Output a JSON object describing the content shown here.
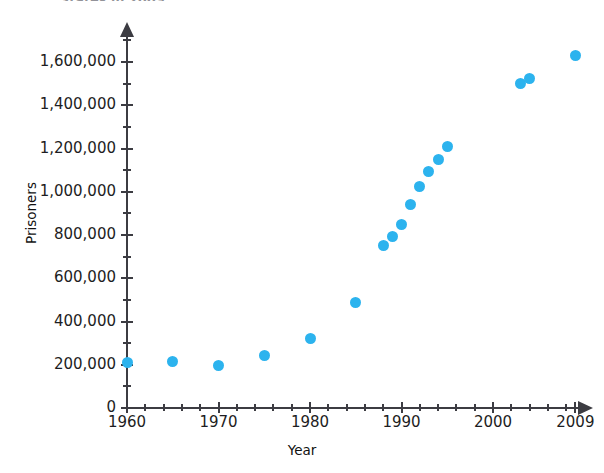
{
  "chart_data": {
    "type": "scatter",
    "title": "States in 2009",
    "xlabel": "Year",
    "ylabel": "Prisoners",
    "xlim": [
      1960,
      2009
    ],
    "ylim": [
      0,
      1700000
    ],
    "grid": false,
    "legend": null,
    "marker_color": "#2cb3ee",
    "axis_color": "#3c3c42",
    "x_ticks_labeled": [
      "1960",
      "1970",
      "1980",
      "1990",
      "2000",
      "2009"
    ],
    "x_tick_values": [
      1960,
      1970,
      1980,
      1990,
      2000,
      2009
    ],
    "x_minor_tick_step": 2,
    "y_ticks_labeled": [
      "0",
      "200,000",
      "400,000",
      "600,000",
      "800,000",
      "1,000,000",
      "1,200,000",
      "1,400,000",
      "1,600,000"
    ],
    "y_tick_values": [
      0,
      200000,
      400000,
      600000,
      800000,
      1000000,
      1200000,
      1400000,
      1600000
    ],
    "y_minor_tick_step": 100000,
    "x": [
      1960,
      1965,
      1970,
      1975,
      1980,
      1985,
      1988,
      1989,
      1990,
      1991,
      1992,
      1993,
      1994,
      1995,
      2003,
      2004,
      2009
    ],
    "values": [
      210000,
      213000,
      196000,
      245000,
      320000,
      487000,
      750000,
      795000,
      850000,
      940000,
      1025000,
      1095000,
      1150000,
      1210000,
      1500000,
      1525000,
      1630000
    ],
    "points": [
      {
        "x": 1960,
        "y": 210000
      },
      {
        "x": 1965,
        "y": 213000
      },
      {
        "x": 1970,
        "y": 196000
      },
      {
        "x": 1975,
        "y": 245000
      },
      {
        "x": 1980,
        "y": 320000
      },
      {
        "x": 1985,
        "y": 487000
      },
      {
        "x": 1988,
        "y": 750000
      },
      {
        "x": 1989,
        "y": 795000
      },
      {
        "x": 1990,
        "y": 850000
      },
      {
        "x": 1991,
        "y": 940000
      },
      {
        "x": 1992,
        "y": 1025000
      },
      {
        "x": 1993,
        "y": 1095000
      },
      {
        "x": 1994,
        "y": 1150000
      },
      {
        "x": 1995,
        "y": 1210000
      },
      {
        "x": 2003,
        "y": 1500000
      },
      {
        "x": 2004,
        "y": 1525000
      },
      {
        "x": 2009,
        "y": 1630000
      }
    ]
  }
}
